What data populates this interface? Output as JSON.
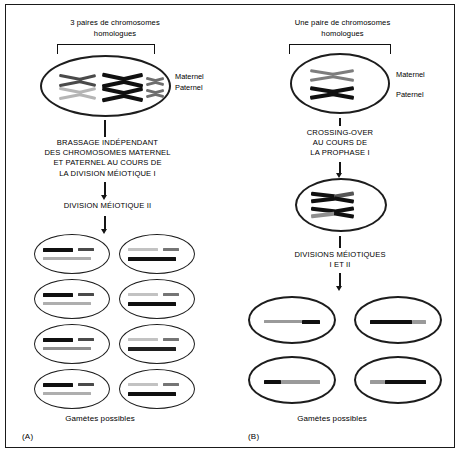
{
  "figure": {
    "title_a": "3 paires de chromosomes homologues",
    "title_b": "Une paire de chromosomes homologues"
  },
  "panel_a": {
    "letter": "(A)",
    "heading_line1": "3 paires de chromosomes",
    "heading_line2": "homologues",
    "label_maternal": "Maternel",
    "label_paternal": "Paternel",
    "step1_line1": "BRASSAGE INDÉPENDANT",
    "step1_line2": "DES CHROMOSOMES MATERNEL",
    "step1_line3": "ET PATERNEL AU COURS DE",
    "step1_line4": "LA DIVISION MÉIOTIQUE I",
    "step2_line1": "DIVISION MÉIOTIQUE II",
    "gametes_label": "Gamètes possibles",
    "parent_cell": {
      "name": "parent-cell-three-pairs",
      "pairs": [
        {
          "id": "pair-medium",
          "size": "medium",
          "maternal_color": "#4a4a4a",
          "paternal_color": "#b0b0b0"
        },
        {
          "id": "pair-large",
          "size": "large",
          "maternal_color": "#101010",
          "paternal_color": "#101010"
        },
        {
          "id": "pair-small",
          "size": "small",
          "maternal_color": "#6e6e6e",
          "paternal_color": "#6e6e6e"
        }
      ]
    },
    "gametes": [
      {
        "id": "gamete-a1",
        "top_long_color": "#101010",
        "top_short_color": "#4a4a4a",
        "bottom_long_color": "#a8a8a8"
      },
      {
        "id": "gamete-a2",
        "top_long_color": "#c0c0c0",
        "top_short_color": "#6e6e6e",
        "bottom_long_color": "#101010"
      },
      {
        "id": "gamete-a3",
        "top_long_color": "#101010",
        "top_short_color": "#4a4a4a",
        "bottom_long_color": "#a8a8a8"
      },
      {
        "id": "gamete-a4",
        "top_long_color": "#c0c0c0",
        "top_short_color": "#6e6e6e",
        "bottom_long_color": "#101010"
      },
      {
        "id": "gamete-a5",
        "top_long_color": "#101010",
        "top_short_color": "#4a4a4a",
        "bottom_long_color": "#8a8a8a"
      },
      {
        "id": "gamete-a6",
        "top_long_color": "#c0c0c0",
        "top_short_color": "#6e6e6e",
        "bottom_long_color": "#202020"
      },
      {
        "id": "gamete-a7",
        "top_long_color": "#101010",
        "top_short_color": "#4a4a4a",
        "bottom_long_color": "#a8a8a8"
      },
      {
        "id": "gamete-a8",
        "top_long_color": "#c0c0c0",
        "top_short_color": "#6e6e6e",
        "bottom_long_color": "#101010"
      }
    ]
  },
  "panel_b": {
    "letter": "(B)",
    "heading_line1": "Une paire de chromosomes",
    "heading_line2": "homologues",
    "label_maternal": "Maternel",
    "label_paternal": "Paternel",
    "step1_line1": "CROSSING-OVER",
    "step1_line2": "AU COURS DE",
    "step1_line3": "LA PROPHASE I",
    "step2_line1": "DIVISIONS MÉIOTIQUES",
    "step2_line2": "I ET II",
    "gametes_label": "Gamètes possibles",
    "parent_cell": {
      "name": "parent-cell-one-pair",
      "maternal_color": "#7d7d7d",
      "paternal_color": "#101010"
    },
    "crossover_cell": {
      "name": "crossover-cell",
      "chromosome_top_left_color": "#101010",
      "chromosome_top_right_color": "#555555",
      "chromosome_bottom_left_color": "#101010",
      "chromosome_bottom_right_color": "#8a8a8a"
    },
    "gametes": [
      {
        "id": "gamete-b1",
        "left_color": "#9a9a9a",
        "right_color": "#101010",
        "split": 62
      },
      {
        "id": "gamete-b2",
        "left_color": "#101010",
        "right_color": "#9a9a9a",
        "split": 70
      },
      {
        "id": "gamete-b3",
        "left_color": "#101010",
        "right_color": "#9a9a9a",
        "split": 28
      },
      {
        "id": "gamete-b4",
        "left_color": "#9a9a9a",
        "right_color": "#101010",
        "split": 26
      }
    ]
  },
  "colors": {
    "ink": "#1a1a1a",
    "maternal_gray": "#8a8a8a",
    "paternal_black": "#101010",
    "background": "#ffffff"
  }
}
